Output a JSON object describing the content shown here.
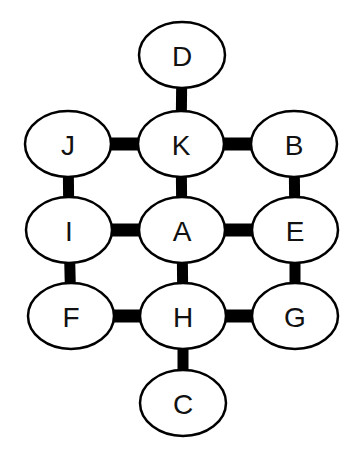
{
  "diagram": {
    "type": "node-graph",
    "colors": {
      "background": "#ffffff",
      "stroke": "#000000",
      "connector": "#000000",
      "fill": "#ffffff",
      "text": "#111111"
    },
    "nodes": [
      {
        "id": "D",
        "label": "D",
        "cx": 182,
        "cy": 55
      },
      {
        "id": "J",
        "label": "J",
        "cx": 68,
        "cy": 144
      },
      {
        "id": "K",
        "label": "K",
        "cx": 181,
        "cy": 144
      },
      {
        "id": "B",
        "label": "B",
        "cx": 294,
        "cy": 144
      },
      {
        "id": "I",
        "label": "I",
        "cx": 69,
        "cy": 230
      },
      {
        "id": "A",
        "label": "A",
        "cx": 182,
        "cy": 230
      },
      {
        "id": "E",
        "label": "E",
        "cx": 295,
        "cy": 230
      },
      {
        "id": "F",
        "label": "F",
        "cx": 71,
        "cy": 316
      },
      {
        "id": "H",
        "label": "H",
        "cx": 183,
        "cy": 316
      },
      {
        "id": "G",
        "label": "G",
        "cx": 295,
        "cy": 316
      },
      {
        "id": "C",
        "label": "C",
        "cx": 183,
        "cy": 403
      }
    ],
    "edges": [
      [
        "D",
        "K"
      ],
      [
        "J",
        "K"
      ],
      [
        "K",
        "B"
      ],
      [
        "J",
        "I"
      ],
      [
        "K",
        "A"
      ],
      [
        "B",
        "E"
      ],
      [
        "I",
        "A"
      ],
      [
        "A",
        "E"
      ],
      [
        "I",
        "F"
      ],
      [
        "A",
        "H"
      ],
      [
        "E",
        "G"
      ],
      [
        "F",
        "H"
      ],
      [
        "H",
        "G"
      ],
      [
        "H",
        "C"
      ]
    ]
  }
}
